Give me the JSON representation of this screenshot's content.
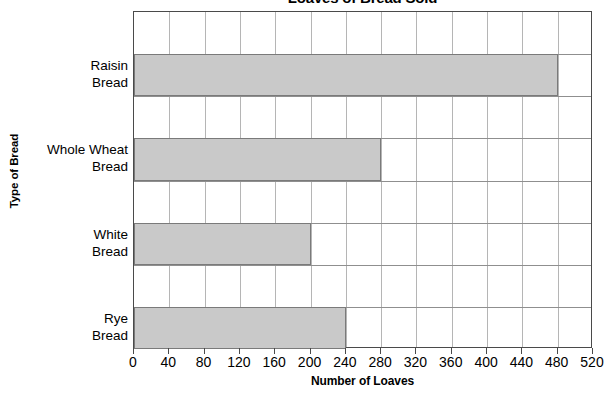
{
  "chart_data": {
    "type": "bar",
    "orientation": "horizontal",
    "title": "Loaves of Bread Sold",
    "xlabel": "Number of Loaves",
    "ylabel": "Type of Bread",
    "categories": [
      "Raisin Bread",
      "Whole Wheat Bread",
      "White Bread",
      "Rye Bread"
    ],
    "category_lines": [
      [
        "Raisin",
        "Bread"
      ],
      [
        "Whole Wheat",
        "Bread"
      ],
      [
        "White",
        "Bread"
      ],
      [
        "Rye",
        "Bread"
      ]
    ],
    "values": [
      480,
      280,
      200,
      240
    ],
    "xlim": [
      0,
      520
    ],
    "xticks": [
      0,
      40,
      80,
      120,
      160,
      200,
      240,
      280,
      320,
      360,
      400,
      440,
      480,
      520
    ],
    "xtick_labels": [
      "0",
      "40",
      "80",
      "120",
      "160",
      "200",
      "200",
      "280",
      "320",
      "360",
      "400",
      "440",
      "480",
      "520"
    ],
    "grid": "vertical-and-horizontal",
    "legend": null,
    "bar_fill_color": "#c9c9c9",
    "bar_border_color": "#7a7a7a",
    "axis_color": "#4a4a4a",
    "grid_color": "#b5b5b5"
  },
  "axis": {
    "tick_labels": [
      "0",
      "40",
      "80",
      "120",
      "160",
      "200",
      "240",
      "280",
      "320",
      "360",
      "400",
      "440",
      "480",
      "520"
    ]
  }
}
